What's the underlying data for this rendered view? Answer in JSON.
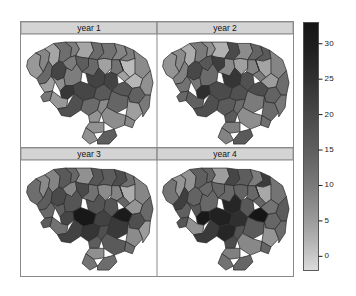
{
  "figure": {
    "type": "trellis-choropleth-map-grid",
    "background_color": "#ffffff",
    "frame_color": "#8a8a8a",
    "strip_background_color": "#d4d4d4",
    "map_outline_color": "#2b2b2b"
  },
  "panels": [
    {
      "id": "panel-year-1",
      "title": "year 1",
      "row": 0,
      "col": 0
    },
    {
      "id": "panel-year-2",
      "title": "year 2",
      "row": 0,
      "col": 1
    },
    {
      "id": "panel-year-3",
      "title": "year 3",
      "row": 1,
      "col": 0
    },
    {
      "id": "panel-year-4",
      "title": "year 4",
      "row": 1,
      "col": 1
    }
  ],
  "colorbar": {
    "name": "legend-colorbar",
    "orientation": "vertical",
    "min": -2,
    "max": 33,
    "top_color": "#161616",
    "bottom_color": "#dadada",
    "ticks": [
      {
        "label": "30",
        "value": 30
      },
      {
        "label": "25",
        "value": 25
      },
      {
        "label": "20",
        "value": 20
      },
      {
        "label": "15",
        "value": 15
      },
      {
        "label": "10",
        "value": 10
      },
      {
        "label": "5",
        "value": 5
      },
      {
        "label": "0",
        "value": 0
      }
    ]
  },
  "chart_data": {
    "type": "heatmap",
    "title": "",
    "xlabel": "",
    "ylabel": "",
    "subtitle": "Four-panel choropleth map of South Carolina counties shaded by value, one panel per year",
    "legend_position": "right",
    "grid": false,
    "colormap": "grayscale (dark = high, light = low)",
    "zlim": [
      -2,
      33
    ],
    "panel_titles": [
      "year 1",
      "year 2",
      "year 3",
      "year 4"
    ],
    "legend_ticks": [
      0,
      5,
      10,
      15,
      20,
      25,
      30
    ],
    "regions": [
      "Oconee",
      "Pickens",
      "Greenville",
      "Spartanburg",
      "Cherokee",
      "York",
      "Chester",
      "Lancaster",
      "Chesterfield",
      "Marlboro",
      "Dillon",
      "Horry",
      "Marion",
      "Florence",
      "Darlington",
      "Lee",
      "Kershaw",
      "Fairfield",
      "Union",
      "Laurens",
      "Anderson",
      "Abbeville",
      "Greenwood",
      "Newberry",
      "Richland",
      "Sumter",
      "Clarendon",
      "Williamsburg",
      "Georgetown",
      "Berkeley",
      "Charleston",
      "Dorchester",
      "Colleton",
      "Beaufort",
      "Jasper",
      "Hampton",
      "Allendale",
      "Bamberg",
      "Orangeburg",
      "Calhoun",
      "Lexington",
      "Saluda",
      "Edgefield",
      "McCormick",
      "Aiken",
      "Barnwell",
      "Heath Springs"
    ],
    "series": [
      {
        "name": "year 1",
        "values": [
          12,
          10,
          9,
          14,
          11,
          10,
          17,
          13,
          16,
          19,
          15,
          9,
          18,
          20,
          16,
          21,
          14,
          13,
          11,
          12,
          10,
          13,
          15,
          14,
          22,
          20,
          24,
          18,
          14,
          26,
          27,
          24,
          19,
          12,
          10,
          13,
          16,
          18,
          21,
          17,
          15,
          13,
          11,
          10,
          14,
          16,
          12
        ]
      },
      {
        "name": "year 2",
        "values": [
          13,
          11,
          10,
          15,
          12,
          11,
          18,
          14,
          17,
          20,
          16,
          10,
          19,
          21,
          17,
          22,
          15,
          14,
          12,
          13,
          11,
          14,
          16,
          15,
          23,
          21,
          25,
          19,
          15,
          27,
          28,
          25,
          20,
          13,
          11,
          14,
          17,
          19,
          22,
          18,
          16,
          14,
          12,
          11,
          15,
          17,
          13
        ]
      },
      {
        "name": "year 3",
        "values": [
          14,
          12,
          11,
          16,
          13,
          12,
          19,
          15,
          18,
          21,
          17,
          11,
          20,
          22,
          18,
          23,
          16,
          15,
          13,
          14,
          12,
          15,
          17,
          16,
          24,
          22,
          26,
          20,
          16,
          28,
          29,
          26,
          21,
          14,
          12,
          15,
          18,
          20,
          23,
          19,
          17,
          15,
          13,
          12,
          16,
          18,
          14
        ]
      },
      {
        "name": "year 4",
        "values": [
          15,
          13,
          12,
          17,
          14,
          13,
          20,
          16,
          19,
          22,
          18,
          12,
          21,
          23,
          19,
          24,
          17,
          16,
          14,
          15,
          13,
          16,
          18,
          17,
          25,
          23,
          27,
          21,
          17,
          32,
          33,
          30,
          22,
          15,
          13,
          16,
          19,
          21,
          24,
          20,
          18,
          16,
          14,
          13,
          17,
          19,
          15
        ]
      }
    ]
  }
}
